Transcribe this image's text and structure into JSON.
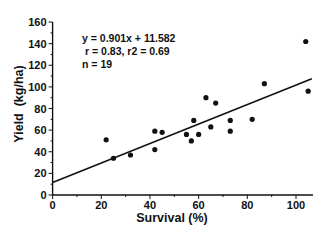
{
  "chart_data": {
    "type": "scatter",
    "title": "",
    "xlabel": "Survival (%)",
    "ylabel": "Yield  (kg/ha)",
    "xlim": [
      0,
      107
    ],
    "ylim": [
      0,
      160
    ],
    "x_ticks": [
      0,
      20,
      40,
      60,
      80,
      100
    ],
    "y_ticks": [
      0,
      20,
      40,
      60,
      80,
      100,
      120,
      140,
      160
    ],
    "grid": false,
    "legend": null,
    "series": [
      {
        "name": "observations",
        "points": [
          {
            "x": 22,
            "y": 51
          },
          {
            "x": 25,
            "y": 34
          },
          {
            "x": 32,
            "y": 37
          },
          {
            "x": 42,
            "y": 59
          },
          {
            "x": 45,
            "y": 58
          },
          {
            "x": 42,
            "y": 42
          },
          {
            "x": 55,
            "y": 56
          },
          {
            "x": 57,
            "y": 50
          },
          {
            "x": 58,
            "y": 69
          },
          {
            "x": 60,
            "y": 56
          },
          {
            "x": 63,
            "y": 90
          },
          {
            "x": 65,
            "y": 63
          },
          {
            "x": 67,
            "y": 85
          },
          {
            "x": 73,
            "y": 69
          },
          {
            "x": 73,
            "y": 59
          },
          {
            "x": 82,
            "y": 70
          },
          {
            "x": 87,
            "y": 103
          },
          {
            "x": 104,
            "y": 142
          },
          {
            "x": 105,
            "y": 96
          }
        ]
      }
    ],
    "regression": {
      "slope": 0.901,
      "intercept": 11.582,
      "x_range": [
        0,
        106.5
      ]
    },
    "annotations": [
      "y = 0.901x + 11.582",
      " r = 0.83, r2 = 0.69",
      "n = 19"
    ]
  },
  "labels": {
    "xlabel": "Survival (%)",
    "ylabel": "Yield  (kg/ha)",
    "equation": "y = 0.901x + 11.582",
    "stats": "r = 0.83, r2 = 0.69",
    "n": "n = 19"
  }
}
